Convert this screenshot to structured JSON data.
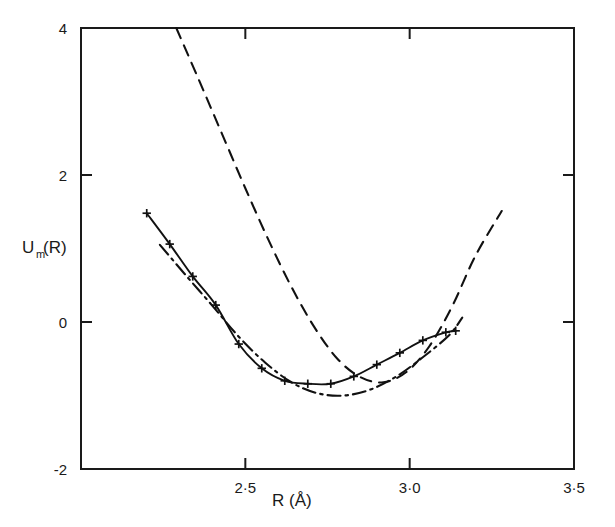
{
  "chart_data": {
    "type": "line",
    "title": "",
    "subtitle": "",
    "xlabel": "R (Å)",
    "ylabel": "U",
    "ylabel_sub": "m",
    "ylabel_tail": "(R)",
    "ylabel_full": "Um(R)",
    "xlim": [
      2.0,
      3.5
    ],
    "ylim": [
      -2,
      4
    ],
    "xticks": [
      2.5,
      3.0,
      3.5
    ],
    "xtick_labels": [
      "2·5",
      "3·0",
      "3·5"
    ],
    "yticks": [
      4,
      2,
      0,
      -2
    ],
    "ytick_labels": [
      "4",
      "2",
      "0",
      "-2"
    ],
    "grid": false,
    "legend": "none",
    "axis_color": "#1a1a1a",
    "series": [
      {
        "name": "solid-with-markers",
        "style": "solid",
        "marker": "plus",
        "color": "#111111",
        "points": [
          [
            2.2,
            1.48
          ],
          [
            2.27,
            1.06
          ],
          [
            2.34,
            0.62
          ],
          [
            2.41,
            0.23
          ],
          [
            2.48,
            -0.3
          ],
          [
            2.55,
            -0.63
          ],
          [
            2.62,
            -0.8
          ],
          [
            2.69,
            -0.84
          ],
          [
            2.76,
            -0.84
          ],
          [
            2.83,
            -0.74
          ],
          [
            2.9,
            -0.58
          ],
          [
            2.97,
            -0.42
          ],
          [
            3.04,
            -0.25
          ],
          [
            3.11,
            -0.14
          ],
          [
            3.14,
            -0.12
          ]
        ]
      },
      {
        "name": "dash-dot",
        "style": "dashdot",
        "marker": "none",
        "color": "#111111",
        "points": [
          [
            2.24,
            1.05
          ],
          [
            2.32,
            0.63
          ],
          [
            2.4,
            0.22
          ],
          [
            2.48,
            -0.2
          ],
          [
            2.56,
            -0.55
          ],
          [
            2.64,
            -0.82
          ],
          [
            2.72,
            -0.97
          ],
          [
            2.8,
            -1.0
          ],
          [
            2.88,
            -0.92
          ],
          [
            2.96,
            -0.74
          ],
          [
            3.04,
            -0.48
          ],
          [
            3.12,
            -0.18
          ],
          [
            3.16,
            0.06
          ]
        ]
      },
      {
        "name": "dashed",
        "style": "dashed",
        "marker": "none",
        "color": "#111111",
        "points": [
          [
            2.29,
            4.0
          ],
          [
            2.36,
            3.28
          ],
          [
            2.43,
            2.55
          ],
          [
            2.5,
            1.82
          ],
          [
            2.57,
            1.12
          ],
          [
            2.64,
            0.48
          ],
          [
            2.71,
            -0.07
          ],
          [
            2.78,
            -0.5
          ],
          [
            2.85,
            -0.75
          ],
          [
            2.92,
            -0.82
          ],
          [
            2.99,
            -0.68
          ],
          [
            3.06,
            -0.33
          ],
          [
            3.13,
            0.22
          ],
          [
            3.2,
            0.9
          ],
          [
            3.28,
            1.51
          ]
        ]
      }
    ]
  },
  "axes": {
    "frame": "box",
    "tick_direction": "in"
  }
}
